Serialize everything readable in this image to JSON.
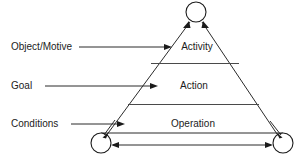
{
  "diagram": {
    "levels": [
      {
        "id": "activity",
        "label": "Activity"
      },
      {
        "id": "action",
        "label": "Action"
      },
      {
        "id": "operation",
        "label": "Operation"
      }
    ],
    "left_labels": [
      {
        "id": "object-motive",
        "label": "Object/Motive",
        "target": "activity"
      },
      {
        "id": "goal",
        "label": "Goal",
        "target": "action"
      },
      {
        "id": "conditions",
        "label": "Conditions",
        "target": "operation"
      }
    ],
    "nodes": [
      {
        "id": "apex-node",
        "label": ""
      },
      {
        "id": "bottom-left-node",
        "label": ""
      },
      {
        "id": "bottom-right-node",
        "label": ""
      }
    ],
    "colors": {
      "background": "#ffffff",
      "stroke": "#2b2b2b",
      "text": "#1b1b1b",
      "divider": "#4a4a4a"
    }
  }
}
